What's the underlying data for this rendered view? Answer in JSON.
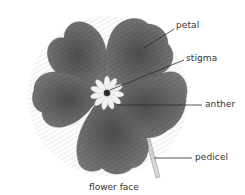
{
  "diagram": {
    "caption": "flower face",
    "labels": {
      "petal": "petal",
      "stigma": "stigma",
      "anther": "anther",
      "pedicel": "pedicel"
    },
    "colors": {
      "petal_fill": "#6e6e6e",
      "petal_dark": "#4a4a4a",
      "anther_fill": "#f0f0f0",
      "stigma_center": "#2a2a2a",
      "pedicel_fill": "#d8d8d8",
      "leader_line": "#2b2b2b"
    }
  }
}
